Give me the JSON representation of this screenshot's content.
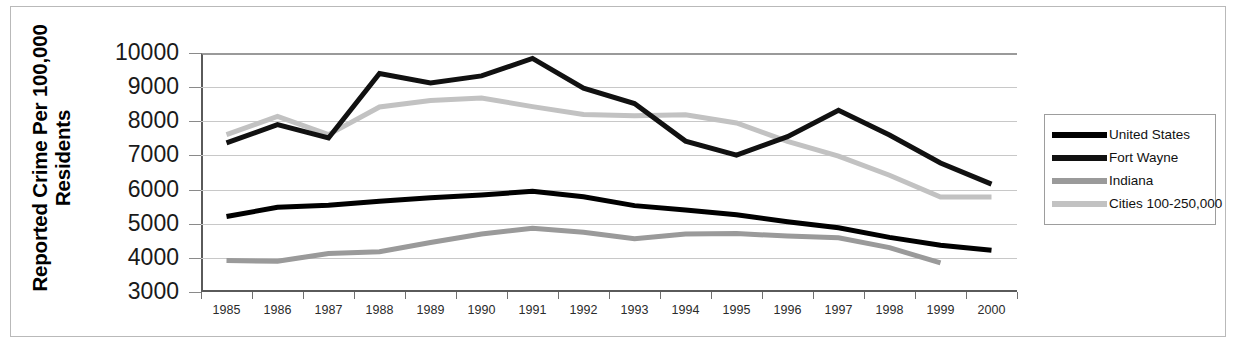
{
  "chart_data": {
    "type": "line",
    "title": "",
    "xlabel": "",
    "ylabel": "Reported Crime Per 100,000 Residents",
    "ylim": [
      3000,
      10000
    ],
    "ytick_values": [
      10000,
      9000,
      8000,
      7000,
      6000,
      5000,
      4000,
      3000
    ],
    "ytick_labels": [
      "10000",
      "9000",
      "8000",
      "7000",
      "6000",
      "5000",
      "4000",
      "3000"
    ],
    "grid": true,
    "legend_position": "right",
    "categories": [
      1985,
      1986,
      1987,
      1988,
      1989,
      1990,
      1991,
      1992,
      1993,
      1994,
      1995,
      1996,
      1997,
      1998,
      1999,
      2000
    ],
    "xtick_labels": [
      "1985",
      "1986",
      "1987",
      "1988",
      "1989",
      "1990",
      "1991",
      "1992",
      "1993",
      "1994",
      "1995",
      "1996",
      "1997",
      "1998",
      "1999",
      "2000"
    ],
    "series": [
      {
        "name": "United States",
        "color": "#000000",
        "width": 5,
        "values": [
          5210,
          5480,
          5540,
          5660,
          5760,
          5840,
          5950,
          5790,
          5530,
          5400,
          5260,
          5060,
          4880,
          4600,
          4370,
          4220
        ]
      },
      {
        "name": "Fort Wayne",
        "color": "#111111",
        "width": 5,
        "values": [
          7370,
          7900,
          7510,
          9400,
          9120,
          9330,
          9840,
          8970,
          8520,
          7420,
          7010,
          7550,
          8320,
          7600,
          6780,
          6160
        ]
      },
      {
        "name": "Indiana",
        "color": "#9a9a9a",
        "width": 5,
        "values": [
          3920,
          3900,
          4130,
          4180,
          4450,
          4700,
          4870,
          4750,
          4560,
          4700,
          4710,
          4640,
          4590,
          4300,
          3850,
          null
        ]
      },
      {
        "name": "Cities 100-250,000",
        "color": "#c2c2c2",
        "width": 5,
        "values": [
          7610,
          8140,
          7610,
          8420,
          8610,
          8680,
          8430,
          8200,
          8160,
          8190,
          7950,
          7410,
          6980,
          6420,
          5780,
          5780
        ]
      }
    ]
  },
  "legend": {
    "items": [
      {
        "label": "United States",
        "color": "#000000"
      },
      {
        "label": "Fort Wayne",
        "color": "#111111"
      },
      {
        "label": "Indiana",
        "color": "#9a9a9a"
      },
      {
        "label": "Cities 100-250,000",
        "color": "#c2c2c2"
      }
    ]
  }
}
